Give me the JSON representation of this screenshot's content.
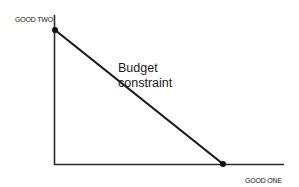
{
  "diagram": {
    "type": "budget-constraint",
    "y_axis_label": "GOOD TWO",
    "x_axis_label": "GOOD ONE",
    "line_label_line1": "Budget",
    "line_label_line2": "constraint",
    "colors": {
      "line": "#1a1a1a",
      "axis": "#2a2a2a",
      "background": "#ffffff"
    },
    "points": [
      {
        "name": "y-intercept",
        "x": 55,
        "y": 30
      },
      {
        "name": "x-intercept",
        "x": 223,
        "y": 164
      }
    ]
  }
}
